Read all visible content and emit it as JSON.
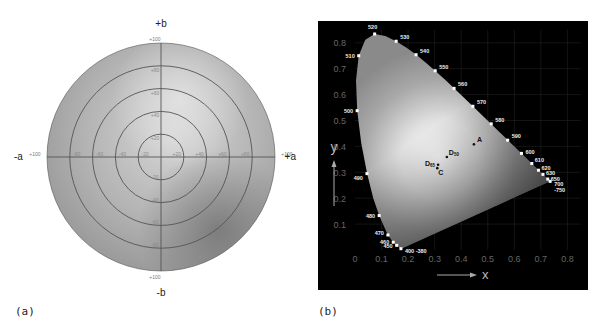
{
  "panel_a": {
    "caption": "(a)",
    "title": "CIELAB a*b* chromaticity plane",
    "axis_labels": {
      "pos_b": "+b",
      "neg_b": "-b",
      "pos_a": "+a",
      "neg_a": "-a"
    },
    "center": [
      161,
      157
    ],
    "radius": 114,
    "rings": [
      20,
      40,
      60,
      80,
      100
    ],
    "ticks_horizontal": [
      "+100",
      "-80",
      "-60",
      "-40",
      "-20",
      "+20",
      "+40",
      "+60",
      "+80",
      "+100"
    ],
    "ticks_vertical_top": [
      "+100",
      "+80",
      "+60",
      "+40",
      "+20"
    ],
    "ticks_vertical_bottom": [
      "-20",
      "-40",
      "-60",
      "-80",
      "+100"
    ]
  },
  "panel_b": {
    "caption": "(b)",
    "title": "CIE 1931 xy chromaticity diagram",
    "x_axis_label": "x",
    "y_axis_label": "y",
    "x_ticks": [
      "0",
      "0.1",
      "0.2",
      "0.3",
      "0.4",
      "0.5",
      "0.6",
      "0.7",
      "0.8"
    ],
    "y_ticks": [
      "0.8",
      "0.7",
      "0.6",
      "0.5",
      "0.4",
      "0.3",
      "0.2",
      "0.1"
    ],
    "wavelengths": [
      {
        "label": "520",
        "x": 0.074,
        "y": 0.834
      },
      {
        "label": "530",
        "x": 0.155,
        "y": 0.806
      },
      {
        "label": "540",
        "x": 0.23,
        "y": 0.754
      },
      {
        "label": "550",
        "x": 0.302,
        "y": 0.692
      },
      {
        "label": "560",
        "x": 0.373,
        "y": 0.624
      },
      {
        "label": "570",
        "x": 0.444,
        "y": 0.555
      },
      {
        "label": "580",
        "x": 0.513,
        "y": 0.487
      },
      {
        "label": "590",
        "x": 0.575,
        "y": 0.424
      },
      {
        "label": "600",
        "x": 0.627,
        "y": 0.373
      },
      {
        "label": "610",
        "x": 0.666,
        "y": 0.334
      },
      {
        "label": "620",
        "x": 0.691,
        "y": 0.308
      },
      {
        "label": "630",
        "x": 0.708,
        "y": 0.292
      },
      {
        "label": "650",
        "x": 0.726,
        "y": 0.274
      },
      {
        "label": "700",
        "x": 0.735,
        "y": 0.265
      },
      {
        "label": "-750",
        "x": 0.735,
        "y": 0.265
      },
      {
        "label": "510",
        "x": 0.014,
        "y": 0.75
      },
      {
        "label": "500",
        "x": 0.008,
        "y": 0.538
      },
      {
        "label": "490",
        "x": 0.045,
        "y": 0.295
      },
      {
        "label": "480",
        "x": 0.091,
        "y": 0.133
      },
      {
        "label": "470",
        "x": 0.124,
        "y": 0.058
      },
      {
        "label": "460",
        "x": 0.144,
        "y": 0.03
      },
      {
        "label": "450",
        "x": 0.157,
        "y": 0.018
      },
      {
        "label": "400 -380",
        "x": 0.173,
        "y": 0.005
      }
    ],
    "illuminants": [
      {
        "label": "A",
        "x": 0.448,
        "y": 0.408
      },
      {
        "label": "D50",
        "x": 0.346,
        "y": 0.359
      },
      {
        "label": "D65",
        "x": 0.313,
        "y": 0.329
      },
      {
        "label": "C",
        "x": 0.31,
        "y": 0.316
      }
    ]
  },
  "chart_data": [
    {
      "type": "diagram",
      "title": "CIELAB a*b* plane",
      "xlabel": "a (-a to +a)",
      "ylabel": "b (-b to +b)",
      "xlim": [
        -100,
        100
      ],
      "ylim": [
        -100,
        100
      ],
      "rings": [
        20,
        40,
        60,
        80,
        100
      ]
    },
    {
      "type": "scatter",
      "title": "CIE 1931 xy chromaticity diagram",
      "xlabel": "x",
      "ylabel": "y",
      "xlim": [
        0,
        0.8
      ],
      "ylim": [
        0,
        0.8
      ],
      "grid": true,
      "series": [
        {
          "name": "Spectral locus (nm)",
          "points": [
            [
              "380",
              0.173,
              0.005
            ],
            [
              "400",
              0.173,
              0.005
            ],
            [
              "450",
              0.157,
              0.018
            ],
            [
              "460",
              0.144,
              0.03
            ],
            [
              "470",
              0.124,
              0.058
            ],
            [
              "480",
              0.091,
              0.133
            ],
            [
              "490",
              0.045,
              0.295
            ],
            [
              "500",
              0.008,
              0.538
            ],
            [
              "510",
              0.014,
              0.75
            ],
            [
              "520",
              0.074,
              0.834
            ],
            [
              "530",
              0.155,
              0.806
            ],
            [
              "540",
              0.23,
              0.754
            ],
            [
              "550",
              0.302,
              0.692
            ],
            [
              "560",
              0.373,
              0.624
            ],
            [
              "570",
              0.444,
              0.555
            ],
            [
              "580",
              0.513,
              0.487
            ],
            [
              "590",
              0.575,
              0.424
            ],
            [
              "600",
              0.627,
              0.373
            ],
            [
              "610",
              0.666,
              0.334
            ],
            [
              "620",
              0.691,
              0.308
            ],
            [
              "630",
              0.708,
              0.292
            ],
            [
              "650",
              0.726,
              0.274
            ],
            [
              "700",
              0.735,
              0.265
            ],
            [
              "750",
              0.735,
              0.265
            ]
          ]
        },
        {
          "name": "Illuminants",
          "points": [
            [
              "A",
              0.448,
              0.408
            ],
            [
              "D50",
              0.346,
              0.359
            ],
            [
              "D65",
              0.313,
              0.329
            ],
            [
              "C",
              0.31,
              0.316
            ]
          ]
        }
      ]
    }
  ]
}
